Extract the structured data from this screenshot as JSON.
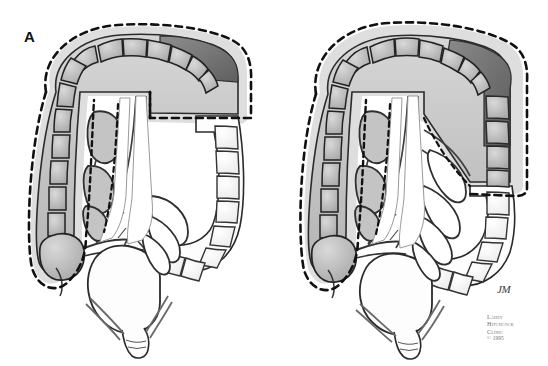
{
  "figure": {
    "background_color": "#ffffff",
    "width": 548,
    "height": 366
  },
  "panels": [
    {
      "id": "A",
      "label": "A",
      "description": "Colon with dashed resection margin enclosing cecum, ascending colon, hepatic flexure, transverse colon and splenic flexure; descending and sigmoid colon left unshaded outside the resection field.",
      "shaded_segments": [
        "cecum",
        "ascending-colon",
        "hepatic-flexure",
        "transverse-colon",
        "splenic-flexure"
      ],
      "unshaded_segments": [
        "descending-colon",
        "sigmoid-colon",
        "rectum"
      ],
      "tumor_segment": "distal-transverse-colon",
      "resection_line": "dashed"
    },
    {
      "id": "B",
      "label": "B",
      "description": "Colon with dashed resection margin extended further distally to include the proximal descending colon in addition to cecum through splenic flexure.",
      "shaded_segments": [
        "cecum",
        "ascending-colon",
        "hepatic-flexure",
        "transverse-colon",
        "splenic-flexure",
        "proximal-descending-colon"
      ],
      "unshaded_segments": [
        "distal-descending-colon",
        "sigmoid-colon",
        "rectum"
      ],
      "tumor_segment": "splenic-flexure-proximal-descending-colon",
      "resection_line": "dashed"
    }
  ],
  "artist_signature": "JM",
  "credit": {
    "line1": "Lahey",
    "line2": "Hitchcock",
    "line3": "Clinic",
    "line4": "© 1995"
  },
  "colors": {
    "ink": "#1c1c1c",
    "outline": "#2b2b2b",
    "shade_light": "#c8c8c8",
    "shade_mid": "#aaaaaa",
    "shade_dark": "#7d7d7d",
    "shade_tumor": "#6a6a6a",
    "vessel": "#4a4a4a",
    "white": "#ffffff",
    "credit_text": "#707070"
  }
}
